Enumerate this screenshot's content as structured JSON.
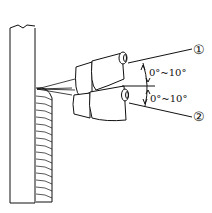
{
  "diagram": {
    "type": "welding-torch-angle-illustration",
    "angle_labels": [
      "0°~10°",
      "0°~10°"
    ],
    "position_labels": [
      "①",
      "②"
    ],
    "components": [
      "vertical-plate",
      "weld-bead",
      "torch-position-1",
      "torch-position-2",
      "arc-lines",
      "angle-indicator"
    ],
    "colors": {
      "line": "#111111",
      "background": "#ffffff"
    }
  }
}
